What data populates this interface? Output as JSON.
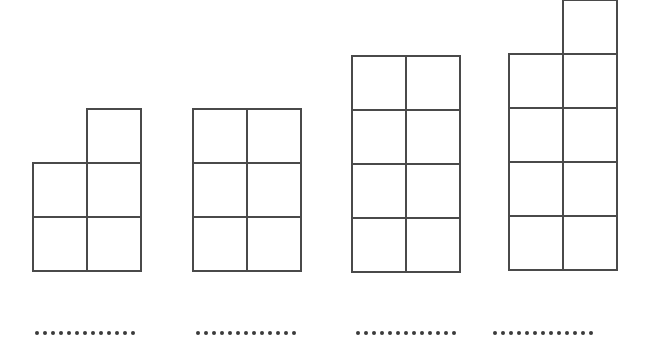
{
  "page": {
    "background_color": "#ffffff",
    "width": 647,
    "height": 342
  },
  "style": {
    "cell_size": 54,
    "stroke_color": "#4a4a4a",
    "stroke_width": 2,
    "dot_color": "#3a3a3a",
    "dot_size": 4,
    "dot_spacing": 8,
    "fill_color": "#ffffff"
  },
  "chart_data": {
    "type": "diagram",
    "xlabel": "",
    "ylabel": "",
    "categories": [
      "Figure 1",
      "Figure 2",
      "Figure 3",
      "Figure 4"
    ],
    "values": [
      5,
      6,
      8,
      9
    ],
    "series": [
      {
        "name": "squares per figure",
        "values": [
          5,
          6,
          8,
          9
        ]
      },
      {
        "name": "rows in full block",
        "values": [
          2,
          3,
          4,
          4
        ]
      },
      {
        "name": "columns",
        "values": [
          2,
          2,
          2,
          2
        ]
      },
      {
        "name": "extra top square",
        "values": [
          1,
          0,
          0,
          1
        ]
      }
    ],
    "legend_position": "none",
    "grid": false
  },
  "figures": [
    {
      "id": "figure-1",
      "square_count": 5,
      "origin_x": 32,
      "origin_y": 108,
      "cells": [
        {
          "col": 1,
          "row": 0
        },
        {
          "col": 0,
          "row": 1
        },
        {
          "col": 1,
          "row": 1
        },
        {
          "col": 0,
          "row": 2
        },
        {
          "col": 1,
          "row": 2
        }
      ],
      "answer": {
        "x": 35,
        "y": 331,
        "dots": 13
      }
    },
    {
      "id": "figure-2",
      "square_count": 6,
      "origin_x": 192,
      "origin_y": 108,
      "cells": [
        {
          "col": 0,
          "row": 0
        },
        {
          "col": 1,
          "row": 0
        },
        {
          "col": 0,
          "row": 1
        },
        {
          "col": 1,
          "row": 1
        },
        {
          "col": 0,
          "row": 2
        },
        {
          "col": 1,
          "row": 2
        }
      ],
      "answer": {
        "x": 196,
        "y": 331,
        "dots": 13
      }
    },
    {
      "id": "figure-3",
      "square_count": 8,
      "origin_x": 351,
      "origin_y": 55,
      "cells": [
        {
          "col": 0,
          "row": 0
        },
        {
          "col": 1,
          "row": 0
        },
        {
          "col": 0,
          "row": 1
        },
        {
          "col": 1,
          "row": 1
        },
        {
          "col": 0,
          "row": 2
        },
        {
          "col": 1,
          "row": 2
        },
        {
          "col": 0,
          "row": 3
        },
        {
          "col": 1,
          "row": 3
        }
      ],
      "answer": {
        "x": 356,
        "y": 331,
        "dots": 13
      }
    },
    {
      "id": "figure-4",
      "square_count": 9,
      "origin_x": 508,
      "origin_y": -1,
      "cells": [
        {
          "col": 1,
          "row": 0
        },
        {
          "col": 0,
          "row": 1
        },
        {
          "col": 1,
          "row": 1
        },
        {
          "col": 0,
          "row": 2
        },
        {
          "col": 1,
          "row": 2
        },
        {
          "col": 0,
          "row": 3
        },
        {
          "col": 1,
          "row": 3
        },
        {
          "col": 0,
          "row": 4
        },
        {
          "col": 1,
          "row": 4
        }
      ],
      "answer": {
        "x": 493,
        "y": 331,
        "dots": 13
      }
    }
  ]
}
